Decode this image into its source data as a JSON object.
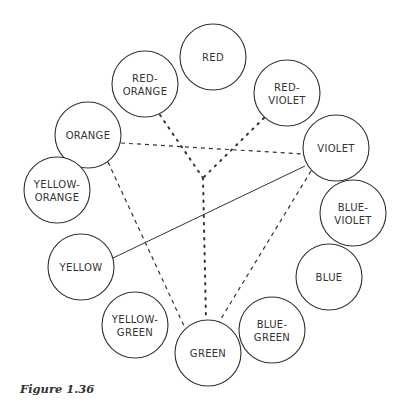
{
  "figure": {
    "caption": "Figure 1.36",
    "circle_radius": 33,
    "line_color": "#333333",
    "hub": {
      "x": 203,
      "y": 178
    },
    "circles": [
      {
        "id": "red",
        "lines": [
          "RED"
        ],
        "x": 213,
        "y": 57
      },
      {
        "id": "red-orange",
        "lines": [
          "RED-",
          "ORANGE"
        ],
        "x": 145,
        "y": 84
      },
      {
        "id": "red-violet",
        "lines": [
          "RED-",
          "VIOLET"
        ],
        "x": 287,
        "y": 93
      },
      {
        "id": "orange",
        "lines": [
          "ORANGE"
        ],
        "x": 88,
        "y": 135
      },
      {
        "id": "violet",
        "lines": [
          "VIOLET"
        ],
        "x": 336,
        "y": 148
      },
      {
        "id": "yellow-orange",
        "lines": [
          "YELLOW-",
          "ORANGE"
        ],
        "x": 57,
        "y": 190
      },
      {
        "id": "blue-violet",
        "lines": [
          "BLUE-",
          "VIOLET"
        ],
        "x": 353,
        "y": 213
      },
      {
        "id": "yellow",
        "lines": [
          "YELLOW"
        ],
        "x": 81,
        "y": 267
      },
      {
        "id": "blue",
        "lines": [
          "BLUE"
        ],
        "x": 329,
        "y": 277
      },
      {
        "id": "yellow-green",
        "lines": [
          "YELLOW-",
          "GREEN"
        ],
        "x": 135,
        "y": 325
      },
      {
        "id": "blue-green",
        "lines": [
          "BLUE-",
          "GREEN"
        ],
        "x": 272,
        "y": 330
      },
      {
        "id": "green",
        "lines": [
          "GREEN"
        ],
        "x": 208,
        "y": 353
      }
    ],
    "connections": [
      {
        "from": "orange",
        "to": "violet",
        "style": "dashed",
        "x1": 121,
        "y1": 143,
        "x2": 303,
        "y2": 154
      },
      {
        "from": "orange",
        "to": "green",
        "style": "dashed",
        "x1": 108,
        "y1": 162,
        "x2": 184,
        "y2": 326
      },
      {
        "from": "violet",
        "to": "green",
        "style": "dashed",
        "x1": 311,
        "y1": 171,
        "x2": 219,
        "y2": 322
      },
      {
        "from": "yellow",
        "to": "violet",
        "style": "solid",
        "x1": 113,
        "y1": 258,
        "x2": 305,
        "y2": 166
      },
      {
        "from": "red-orange",
        "to": "hub",
        "style": "dotted",
        "x1": 160,
        "y1": 115,
        "x2": 203,
        "y2": 178
      },
      {
        "from": "red-violet",
        "to": "hub",
        "style": "dotted",
        "x1": 264,
        "y1": 118,
        "x2": 203,
        "y2": 178
      },
      {
        "from": "hub",
        "to": "green",
        "style": "dotted",
        "x1": 203,
        "y1": 178,
        "x2": 206,
        "y2": 320
      }
    ]
  }
}
